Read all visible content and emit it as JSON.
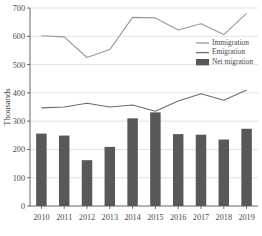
{
  "chart_data": {
    "type": "bar",
    "title": "",
    "xlabel": "",
    "ylabel": "Thousands",
    "ylim": [
      0,
      700
    ],
    "ytick_step": 100,
    "yticks": [
      0,
      100,
      200,
      300,
      400,
      500,
      600,
      700
    ],
    "categories": [
      "2010",
      "2011",
      "2012",
      "2013",
      "2014",
      "2015",
      "2016",
      "2017",
      "2018",
      "2019"
    ],
    "grid": true,
    "legend_position": "upper-right",
    "series": [
      {
        "name": "Immigration",
        "type": "line",
        "color": "#9a9a9a",
        "values": [
          602,
          598,
          525,
          553,
          667,
          665,
          622,
          644,
          606,
          681
        ]
      },
      {
        "name": "Emigration",
        "type": "line",
        "color": "#6d6d6d",
        "values": [
          347,
          350,
          363,
          350,
          357,
          335,
          371,
          397,
          374,
          410
        ]
      },
      {
        "name": "Net migration",
        "type": "bar",
        "color": "#58585a",
        "values": [
          256,
          249,
          162,
          209,
          310,
          331,
          254,
          252,
          235,
          273
        ]
      }
    ]
  },
  "legend": {
    "items": [
      {
        "label": "Immigration",
        "marker": "line",
        "color": "#9a9a9a"
      },
      {
        "label": "Emigration",
        "marker": "line",
        "color": "#6d6d6d"
      },
      {
        "label": "Net migration",
        "marker": "swatch",
        "color": "#58585a"
      }
    ]
  },
  "axes": {
    "y_title": "Thousands"
  }
}
